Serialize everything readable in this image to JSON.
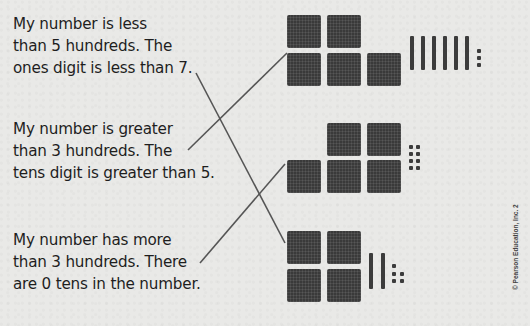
{
  "clues": [
    {
      "lines": [
        "My number is less",
        "than 5 hundreds. The",
        "ones digit is less than 7."
      ]
    },
    {
      "lines": [
        "My number is greater",
        "than 3 hundreds. The",
        "tens digit is greater than 5."
      ]
    },
    {
      "lines": [
        "My number has more",
        "than 3 hundreds. There",
        "are 0 tens in the number."
      ]
    }
  ],
  "models": [
    {
      "hundreds": 5,
      "tens": 6,
      "ones": 3,
      "value": 563
    },
    {
      "hundreds": 5,
      "tens": 0,
      "ones": 8,
      "value": 508
    },
    {
      "hundreds": 4,
      "tens": 2,
      "ones": 5,
      "value": 425
    }
  ],
  "matches": [
    {
      "clue": 1,
      "model": 3
    },
    {
      "clue": 2,
      "model": 1
    },
    {
      "clue": 3,
      "model": 2
    }
  ],
  "copyright": "© Pearson Education, Inc. 2",
  "colors": {
    "background": "#e9e9e7",
    "ink": "#1e1e1e",
    "block": "#3a3a3a",
    "line": "#555555"
  }
}
